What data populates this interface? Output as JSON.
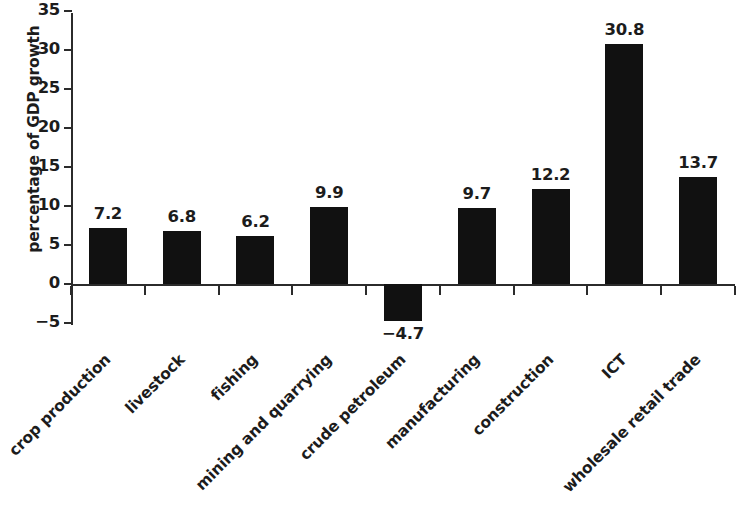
{
  "chart_data": {
    "type": "bar",
    "title": "",
    "subtitle": "",
    "xlabel": "",
    "ylabel": "percentage of GDP growth",
    "ylim": [
      -5,
      35
    ],
    "ytick_values": [
      35,
      30,
      25,
      20,
      15,
      10,
      5,
      0,
      -5
    ],
    "ytick_labels": [
      "35",
      "30",
      "25",
      "20",
      "15",
      "10",
      "5",
      "0",
      "−5"
    ],
    "grid": false,
    "legend": null,
    "bar_color": "#111111",
    "categories": [
      "crop production",
      "livestock",
      "fishing",
      "mining and quarrying",
      "crude petroleum",
      "manufacturing",
      "construction",
      "ICT",
      "wholesale retail trade"
    ],
    "values": [
      7.2,
      6.8,
      6.2,
      9.9,
      -4.7,
      9.7,
      12.2,
      30.8,
      13.7
    ],
    "value_labels": [
      "7.2",
      "6.8",
      "6.2",
      "9.9",
      "−4.7",
      "9.7",
      "12.2",
      "30.8",
      "13.7"
    ]
  }
}
